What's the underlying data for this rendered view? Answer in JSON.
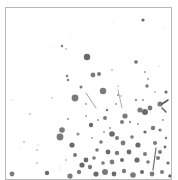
{
  "image": {
    "subject": "paint splatter artwork",
    "background": "#ffffff",
    "frame": {
      "x": 5.5,
      "y": 7.5,
      "w": 166,
      "h": 172,
      "stroke": "#b8b8b8"
    },
    "palette": {
      "dark": "#5a5a5e",
      "mid": "#6e6a72",
      "light": "#8c8890",
      "faint": "#c8c6ca"
    },
    "drops": [
      [
        143,
        20,
        1.6,
        "dark"
      ],
      [
        62,
        46,
        1.2,
        "mid"
      ],
      [
        66,
        49,
        0.8,
        "light"
      ],
      [
        87,
        57,
        3.2,
        "dark"
      ],
      [
        136,
        62,
        1.8,
        "dark"
      ],
      [
        112,
        70,
        0.8,
        "light"
      ],
      [
        145,
        72,
        0.9,
        "light"
      ],
      [
        67,
        76,
        1.2,
        "mid"
      ],
      [
        68,
        80,
        1.2,
        "mid"
      ],
      [
        93,
        75,
        2.4,
        "mid"
      ],
      [
        99,
        74,
        2.0,
        "mid"
      ],
      [
        147,
        86,
        1.7,
        "mid"
      ],
      [
        81,
        87,
        1.5,
        "mid"
      ],
      [
        103,
        91,
        3.2,
        "mid"
      ],
      [
        118,
        95,
        1.1,
        "light"
      ],
      [
        75,
        98,
        3.4,
        "mid"
      ],
      [
        166,
        92,
        1.6,
        "dark"
      ],
      [
        52,
        98,
        0.7,
        "light"
      ],
      [
        136,
        100,
        1.2,
        "light"
      ],
      [
        143,
        100,
        1.0,
        "light"
      ],
      [
        160,
        104,
        2.6,
        "mid"
      ],
      [
        86,
        104,
        0.9,
        "light"
      ],
      [
        107,
        110,
        1.2,
        "mid"
      ],
      [
        145,
        112,
        3.0,
        "dark"
      ],
      [
        140,
        110,
        2.6,
        "mid"
      ],
      [
        150,
        108,
        2.4,
        "mid"
      ],
      [
        125,
        116,
        2.6,
        "mid"
      ],
      [
        105,
        118,
        2.0,
        "mid"
      ],
      [
        30,
        114,
        0.8,
        "light"
      ],
      [
        12,
        100,
        0.8,
        "faint"
      ],
      [
        122,
        122,
        2.0,
        "mid"
      ],
      [
        91,
        125,
        2.2,
        "dark"
      ],
      [
        153,
        128,
        2.2,
        "mid"
      ],
      [
        62,
        130,
        2.8,
        "mid"
      ],
      [
        60,
        137,
        3.4,
        "mid"
      ],
      [
        78,
        134,
        1.6,
        "light"
      ],
      [
        112,
        134,
        2.8,
        "dark"
      ],
      [
        117,
        138,
        2.0,
        "mid"
      ],
      [
        132,
        137,
        1.8,
        "mid"
      ],
      [
        145,
        132,
        1.6,
        "dark"
      ],
      [
        160,
        130,
        1.6,
        "mid"
      ],
      [
        72,
        145,
        2.6,
        "dark"
      ],
      [
        101,
        142,
        1.8,
        "mid"
      ],
      [
        123,
        143,
        2.4,
        "mid"
      ],
      [
        138,
        145,
        2.6,
        "dark"
      ],
      [
        155,
        143,
        2.0,
        "mid"
      ],
      [
        165,
        147,
        1.4,
        "dark"
      ],
      [
        108,
        152,
        2.4,
        "dark"
      ],
      [
        97,
        150,
        1.8,
        "mid"
      ],
      [
        117,
        153,
        2.2,
        "mid"
      ],
      [
        129,
        152,
        2.4,
        "dark"
      ],
      [
        145,
        154,
        2.0,
        "mid"
      ],
      [
        160,
        152,
        2.0,
        "mid"
      ],
      [
        75,
        155,
        2.0,
        "mid"
      ],
      [
        86,
        160,
        2.4,
        "dark"
      ],
      [
        94,
        158,
        1.8,
        "mid"
      ],
      [
        82,
        165,
        2.6,
        "dark"
      ],
      [
        90,
        167,
        2.2,
        "mid"
      ],
      [
        103,
        163,
        1.8,
        "mid"
      ],
      [
        112,
        162,
        2.4,
        "mid"
      ],
      [
        122,
        160,
        2.0,
        "dark"
      ],
      [
        137,
        160,
        2.6,
        "dark"
      ],
      [
        148,
        162,
        1.8,
        "mid"
      ],
      [
        158,
        158,
        2.0,
        "mid"
      ],
      [
        168,
        163,
        1.6,
        "dark"
      ],
      [
        79,
        172,
        2.2,
        "mid"
      ],
      [
        96,
        174,
        2.6,
        "dark"
      ],
      [
        105,
        172,
        3.0,
        "mid"
      ],
      [
        114,
        174,
        2.4,
        "dark"
      ],
      [
        124,
        171,
        2.2,
        "mid"
      ],
      [
        133,
        175,
        2.8,
        "mid"
      ],
      [
        142,
        172,
        2.0,
        "dark"
      ],
      [
        152,
        174,
        2.4,
        "mid"
      ],
      [
        162,
        172,
        2.0,
        "mid"
      ],
      [
        170,
        176,
        1.8,
        "dark"
      ],
      [
        12,
        174,
        2.4,
        "mid"
      ],
      [
        47,
        173,
        2.2,
        "dark"
      ],
      [
        70,
        176,
        2.6,
        "mid"
      ],
      [
        24,
        142,
        0.8,
        "light"
      ],
      [
        21,
        148,
        0.6,
        "faint"
      ],
      [
        38,
        145,
        0.8,
        "faint"
      ],
      [
        37,
        150,
        0.8,
        "light"
      ],
      [
        37,
        163,
        0.8,
        "light"
      ],
      [
        60,
        168,
        0.7,
        "faint"
      ],
      [
        66,
        160,
        0.8,
        "light"
      ],
      [
        116,
        104,
        0.9,
        "light"
      ],
      [
        121,
        96,
        0.8,
        "light"
      ],
      [
        155,
        92,
        0.8,
        "light"
      ],
      [
        148,
        79,
        0.9,
        "light"
      ],
      [
        130,
        122,
        1.2,
        "light"
      ],
      [
        98,
        120,
        1.0,
        "light"
      ],
      [
        86,
        116,
        0.9,
        "light"
      ],
      [
        110,
        128,
        1.0,
        "light"
      ],
      [
        163,
        120,
        1.0,
        "light"
      ],
      [
        166,
        138,
        1.2,
        "mid"
      ],
      [
        138,
        124,
        1.0,
        "light"
      ],
      [
        104,
        132,
        0.9,
        "light"
      ],
      [
        92,
        138,
        0.9,
        "light"
      ],
      [
        68,
        119,
        1.0,
        "light"
      ],
      [
        118,
        86,
        0.7,
        "light"
      ],
      [
        113,
        22,
        0.6,
        "faint"
      ],
      [
        165,
        28,
        0.6,
        "faint"
      ],
      [
        70,
        35,
        0.6,
        "faint"
      ],
      [
        159,
        66,
        0.7,
        "faint"
      ],
      [
        54,
        47,
        0.5,
        "faint"
      ]
    ],
    "streaks": [
      [
        86,
        93,
        96,
        108,
        0.8,
        "light"
      ],
      [
        118,
        90,
        122,
        108,
        0.7,
        "light"
      ],
      [
        156,
        148,
        153,
        170,
        1.2,
        "mid"
      ],
      [
        162,
        104,
        168,
        100,
        1.6,
        "dark"
      ],
      [
        162,
        108,
        166,
        112,
        1.4,
        "dark"
      ]
    ]
  }
}
